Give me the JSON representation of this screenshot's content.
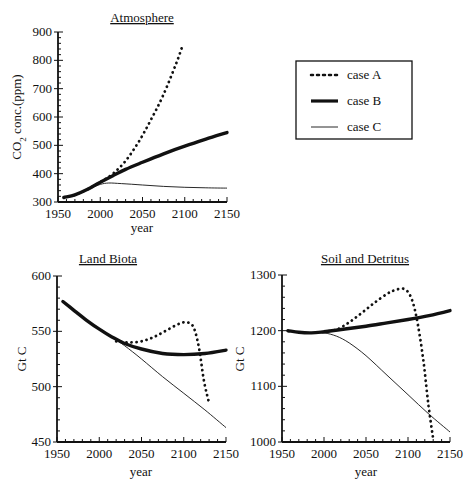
{
  "chart_data": [
    {
      "type": "line",
      "title": "Atmosphere",
      "xlabel": "year",
      "ylabel": "CO2 conc.(ppm)",
      "xlim": [
        1950,
        2150
      ],
      "ylim": [
        300,
        900
      ],
      "xticks": [
        1950,
        2000,
        2050,
        2100,
        2150
      ],
      "yticks": [
        300,
        400,
        500,
        600,
        700,
        800,
        900
      ],
      "grid": false,
      "series": [
        {
          "name": "case A",
          "style": "dotted",
          "x": [
            1957,
            1970,
            1985,
            2000,
            2015,
            2030,
            2045,
            2060,
            2075,
            2090,
            2097
          ],
          "values": [
            316,
            325,
            345,
            370,
            400,
            445,
            510,
            590,
            680,
            790,
            848
          ]
        },
        {
          "name": "case B",
          "style": "thick",
          "x": [
            1957,
            1970,
            1985,
            2000,
            2015,
            2030,
            2050,
            2075,
            2100,
            2125,
            2150
          ],
          "values": [
            316,
            325,
            345,
            370,
            393,
            415,
            440,
            470,
            497,
            522,
            545
          ]
        },
        {
          "name": "case C",
          "style": "thin",
          "x": [
            1957,
            1970,
            1985,
            2000,
            2010,
            2025,
            2050,
            2075,
            2100,
            2125,
            2150
          ],
          "values": [
            316,
            325,
            345,
            362,
            367,
            365,
            360,
            355,
            352,
            350,
            349
          ]
        }
      ]
    },
    {
      "type": "line",
      "title": "Land Biota",
      "xlabel": "year",
      "ylabel": "Gt C",
      "xlim": [
        1950,
        2150
      ],
      "ylim": [
        450,
        600
      ],
      "xticks": [
        1950,
        2000,
        2050,
        2100,
        2150
      ],
      "yticks": [
        450,
        500,
        550,
        600
      ],
      "grid": false,
      "series": [
        {
          "name": "case A",
          "style": "dotted",
          "x": [
            2020,
            2035,
            2050,
            2065,
            2080,
            2095,
            2105,
            2112,
            2118,
            2124,
            2130
          ],
          "values": [
            541,
            540,
            541,
            545,
            551,
            557,
            558,
            553,
            535,
            505,
            485
          ]
        },
        {
          "name": "case B",
          "style": "thick",
          "x": [
            1957,
            1970,
            1985,
            2000,
            2015,
            2030,
            2050,
            2075,
            2100,
            2125,
            2150
          ],
          "values": [
            577,
            569,
            560,
            552,
            545,
            539,
            534,
            530,
            529,
            530,
            533
          ]
        },
        {
          "name": "case C",
          "style": "thin",
          "x": [
            1957,
            1970,
            1985,
            2000,
            2015,
            2030,
            2050,
            2075,
            2100,
            2125,
            2150
          ],
          "values": [
            577,
            569,
            560,
            552,
            545,
            537,
            525,
            509,
            494,
            479,
            463
          ]
        }
      ]
    },
    {
      "type": "line",
      "title": "Soil and Detritus",
      "xlabel": "year",
      "ylabel": "Gt C",
      "xlim": [
        1950,
        2150
      ],
      "ylim": [
        1000,
        1300
      ],
      "xticks": [
        1950,
        2000,
        2050,
        2100,
        2150
      ],
      "yticks": [
        1000,
        1100,
        1200,
        1300
      ],
      "grid": false,
      "series": [
        {
          "name": "case A",
          "style": "dotted",
          "x": [
            2000,
            2015,
            2030,
            2045,
            2060,
            2075,
            2085,
            2095,
            2103,
            2110,
            2118,
            2124,
            2130
          ],
          "values": [
            1198,
            1202,
            1215,
            1232,
            1250,
            1266,
            1273,
            1275,
            1262,
            1225,
            1150,
            1070,
            1005
          ]
        },
        {
          "name": "case B",
          "style": "thick",
          "x": [
            1957,
            1970,
            1985,
            2000,
            2025,
            2050,
            2075,
            2100,
            2125,
            2150
          ],
          "values": [
            1200,
            1197,
            1196,
            1198,
            1203,
            1208,
            1214,
            1220,
            1227,
            1236
          ]
        },
        {
          "name": "case C",
          "style": "thin",
          "x": [
            1957,
            1970,
            1985,
            2000,
            2015,
            2030,
            2050,
            2075,
            2100,
            2125,
            2150
          ],
          "values": [
            1200,
            1197,
            1196,
            1196,
            1190,
            1178,
            1155,
            1120,
            1085,
            1050,
            1018
          ]
        }
      ]
    }
  ],
  "legend": {
    "items": [
      {
        "label": "case A",
        "style": "dotted"
      },
      {
        "label": "case B",
        "style": "thick"
      },
      {
        "label": "case C",
        "style": "thin"
      }
    ]
  },
  "colors": {
    "ink": "#111111",
    "background": "#ffffff"
  }
}
